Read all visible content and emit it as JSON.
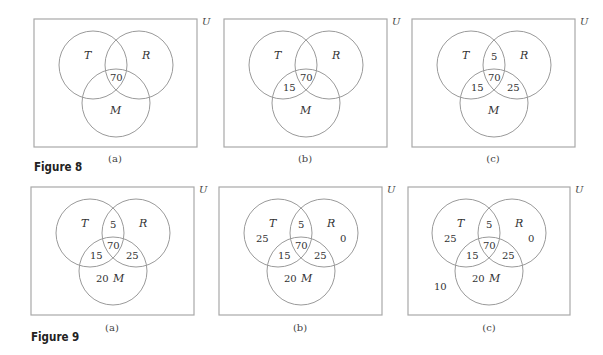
{
  "figures": [
    {
      "title": "Figure 8",
      "panels": [
        {
          "caption": "(a)",
          "universe": "U",
          "sets": {
            "T": "T",
            "R": "R",
            "M": "M"
          },
          "regions": {
            "T_only": "",
            "R_only": "",
            "M_only": "",
            "TR_only": "",
            "TM_only": "",
            "RM_only": "",
            "TRM": "70",
            "outside": ""
          }
        },
        {
          "caption": "(b)",
          "universe": "U",
          "sets": {
            "T": "T",
            "R": "R",
            "M": "M"
          },
          "regions": {
            "T_only": "",
            "R_only": "",
            "M_only": "",
            "TR_only": "",
            "TM_only": "15",
            "RM_only": "",
            "TRM": "70",
            "outside": ""
          }
        },
        {
          "caption": "(c)",
          "universe": "U",
          "sets": {
            "T": "T",
            "R": "R",
            "M": "M"
          },
          "regions": {
            "T_only": "",
            "R_only": "",
            "M_only": "",
            "TR_only": "5",
            "TM_only": "15",
            "RM_only": "25",
            "TRM": "70",
            "outside": ""
          }
        }
      ]
    },
    {
      "title": "Figure 9",
      "panels": [
        {
          "caption": "(a)",
          "universe": "U",
          "sets": {
            "T": "T",
            "R": "R",
            "M": "M"
          },
          "regions": {
            "T_only": "",
            "R_only": "",
            "M_only": "20",
            "TR_only": "5",
            "TM_only": "15",
            "RM_only": "25",
            "TRM": "70",
            "outside": ""
          }
        },
        {
          "caption": "(b)",
          "universe": "U",
          "sets": {
            "T": "T",
            "R": "R",
            "M": "M"
          },
          "regions": {
            "T_only": "25",
            "R_only": "0",
            "M_only": "20",
            "TR_only": "5",
            "TM_only": "15",
            "RM_only": "25",
            "TRM": "70",
            "outside": ""
          }
        },
        {
          "caption": "(c)",
          "universe": "U",
          "sets": {
            "T": "T",
            "R": "R",
            "M": "M"
          },
          "regions": {
            "T_only": "25",
            "R_only": "0",
            "M_only": "20",
            "TR_only": "5",
            "TM_only": "15",
            "RM_only": "25",
            "TRM": "70",
            "outside": "10"
          }
        }
      ]
    }
  ]
}
